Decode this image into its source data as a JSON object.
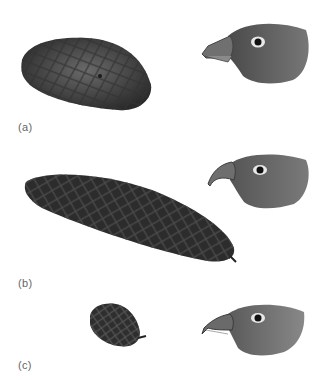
{
  "figure": {
    "panels": [
      {
        "label": "(a)",
        "cone": "short-broad-cone",
        "bird": "thick-bill-crossbill-head"
      },
      {
        "label": "(b)",
        "cone": "long-narrow-cone",
        "bird": "hooked-bill-crossbill-head"
      },
      {
        "label": "(c)",
        "cone": "small-round-cone",
        "bird": "slender-crossed-bill-head"
      }
    ]
  },
  "colors": {
    "background": "#ffffff",
    "cone_dark": "#2e2e2e",
    "cone_mid": "#555555",
    "bird_head": "#5f5f5f",
    "bird_beak": "#7a7a7a",
    "label": "#666666"
  }
}
